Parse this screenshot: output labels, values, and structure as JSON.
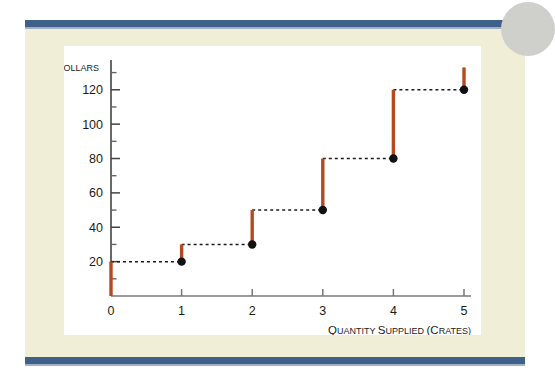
{
  "page": {
    "background_color": "#ffffff",
    "panel_color": "#f0eed7",
    "rule_color": "#3f6089",
    "card_color": "#ffffff",
    "circle_color": "#cfd0cb"
  },
  "chart_data": {
    "type": "line",
    "subtype": "step",
    "title": "",
    "xlabel_parts": {
      "word1_first": "Q",
      "word1_rest": "UANTITY",
      "word2_first": "S",
      "word2_rest": "UPPLIED",
      "word3": "(C",
      "word3_rest": "RATES)"
    },
    "xlabel": "QUANTITY SUPPLIED (CRATES)",
    "ylabel": "DOLLARS",
    "ylabel_first": "D",
    "ylabel_rest": "OLLARS",
    "xlim": [
      0,
      5
    ],
    "ylim": [
      0,
      135
    ],
    "grid": false,
    "legend": null,
    "x_ticks": [
      0,
      1,
      2,
      3,
      4,
      5
    ],
    "x_tick_labels": [
      "0",
      "1",
      "2",
      "3",
      "4",
      "5"
    ],
    "y_ticks": [
      20,
      40,
      60,
      80,
      100,
      120
    ],
    "y_tick_labels": [
      "20",
      "40",
      "60",
      "80",
      "100",
      "120"
    ],
    "y_minor_ticks": [
      10,
      30,
      50,
      70,
      90,
      110,
      130
    ],
    "series": [
      {
        "name": "Supply",
        "style": "step-with-open-risers",
        "tread_color": "#1b1b1b",
        "tread_dash": "3,3",
        "riser_color": "#b5491f",
        "point_color": "#111111",
        "steps": [
          {
            "x_start": 0,
            "x_end": 1,
            "value": 20
          },
          {
            "x_start": 1,
            "x_end": 2,
            "value": 30
          },
          {
            "x_start": 2,
            "x_end": 3,
            "value": 50
          },
          {
            "x_start": 3,
            "x_end": 4,
            "value": 80
          },
          {
            "x_start": 4,
            "x_end": 5,
            "value": 120
          }
        ],
        "points": [
          {
            "x": 1,
            "y": 20
          },
          {
            "x": 2,
            "y": 30
          },
          {
            "x": 3,
            "y": 50
          },
          {
            "x": 4,
            "y": 80
          },
          {
            "x": 5,
            "y": 120
          }
        ],
        "risers": [
          {
            "x": 0,
            "y_from": 0,
            "y_to": 20
          },
          {
            "x": 1,
            "y_from": 20,
            "y_to": 30
          },
          {
            "x": 2,
            "y_from": 30,
            "y_to": 50
          },
          {
            "x": 3,
            "y_from": 50,
            "y_to": 80
          },
          {
            "x": 4,
            "y_from": 80,
            "y_to": 120
          },
          {
            "x": 5,
            "y_from": 120,
            "y_to": 133
          }
        ]
      }
    ]
  }
}
